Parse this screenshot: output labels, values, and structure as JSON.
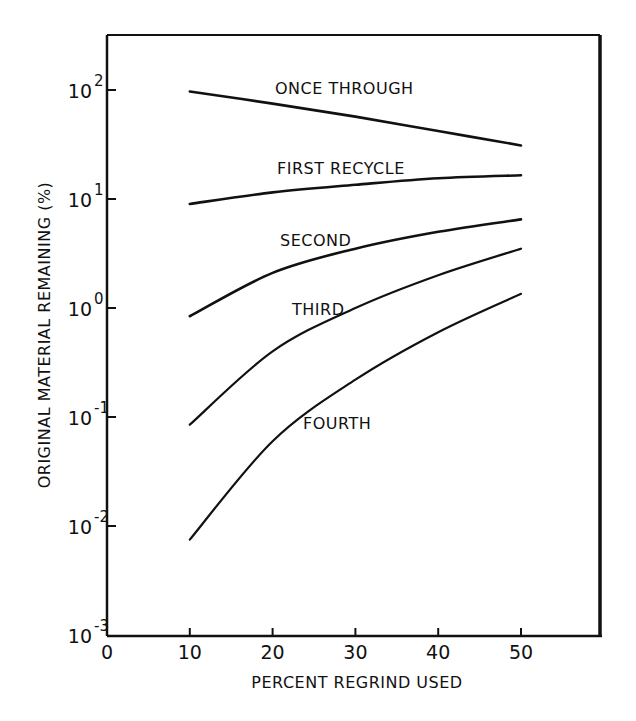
{
  "chart_data": {
    "type": "line",
    "title": "",
    "xlabel": "PERCENT REGRIND USED",
    "ylabel": "ORIGINAL MATERIAL REMAINING (%)",
    "xlim": [
      0,
      60
    ],
    "ylim": [
      0.001,
      300
    ],
    "yscale": "log",
    "grid": false,
    "legend": "inline labels",
    "x_ticks": [
      0,
      10,
      20,
      30,
      40,
      50
    ],
    "y_ticks": [
      {
        "base": "10",
        "exp": "2",
        "value": 100
      },
      {
        "base": "10",
        "exp": "1",
        "value": 10
      },
      {
        "base": "10",
        "exp": "0",
        "value": 1
      },
      {
        "base": "10",
        "exp": "-1",
        "value": 0.1
      },
      {
        "base": "10",
        "exp": "-2",
        "value": 0.01
      },
      {
        "base": "10",
        "exp": "-3",
        "value": 0.001
      }
    ],
    "series": [
      {
        "name": "ONCE THROUGH",
        "x": [
          10,
          20,
          30,
          40,
          50
        ],
        "values": [
          97,
          75,
          57,
          42,
          31
        ],
        "label_pos": [
          275,
          94
        ]
      },
      {
        "name": "FIRST RECYCLE",
        "x": [
          10,
          20,
          30,
          40,
          50
        ],
        "values": [
          9,
          11.5,
          13.5,
          15.5,
          16.5
        ],
        "label_pos": [
          277,
          174
        ]
      },
      {
        "name": "SECOND",
        "x": [
          10,
          20,
          30,
          40,
          50
        ],
        "values": [
          0.84,
          2.1,
          3.5,
          5.0,
          6.5
        ],
        "label_pos": [
          280,
          246
        ]
      },
      {
        "name": "THIRD",
        "x": [
          10,
          20,
          30,
          40,
          50
        ],
        "values": [
          0.085,
          0.4,
          1.0,
          2.0,
          3.5
        ],
        "label_pos": [
          292,
          315
        ]
      },
      {
        "name": "FOURTH",
        "x": [
          10,
          20,
          30,
          40,
          50
        ],
        "values": [
          0.0075,
          0.06,
          0.22,
          0.6,
          1.35
        ],
        "label_pos": [
          303,
          429
        ]
      }
    ]
  }
}
